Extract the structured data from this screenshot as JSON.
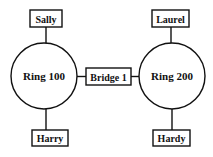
{
  "diagram": {
    "rings": [
      {
        "id": "ring100",
        "label": "Ring 100",
        "cx": 44,
        "cy": 76,
        "r": 33
      },
      {
        "id": "ring200",
        "label": "Ring 200",
        "cx": 172,
        "cy": 76,
        "r": 33
      }
    ],
    "bridge": {
      "label": "Bridge 1",
      "x": 86,
      "y": 68,
      "w": 45,
      "h": 17
    },
    "stations": [
      {
        "id": "sally",
        "label": "Sally",
        "x": 30,
        "y": 10,
        "w": 32,
        "h": 17,
        "ring": "ring100",
        "side": "top"
      },
      {
        "id": "laurel",
        "label": "Laurel",
        "x": 152,
        "y": 10,
        "w": 37,
        "h": 17,
        "ring": "ring200",
        "side": "top"
      },
      {
        "id": "harry",
        "label": "Harry",
        "x": 32,
        "y": 130,
        "w": 36,
        "h": 16,
        "ring": "ring100",
        "side": "bottom"
      },
      {
        "id": "hardy",
        "label": "Hardy",
        "x": 153,
        "y": 130,
        "w": 37,
        "h": 16,
        "ring": "ring200",
        "side": "bottom"
      }
    ],
    "colors": {
      "stroke": "#111111",
      "background": "#ffffff"
    }
  }
}
